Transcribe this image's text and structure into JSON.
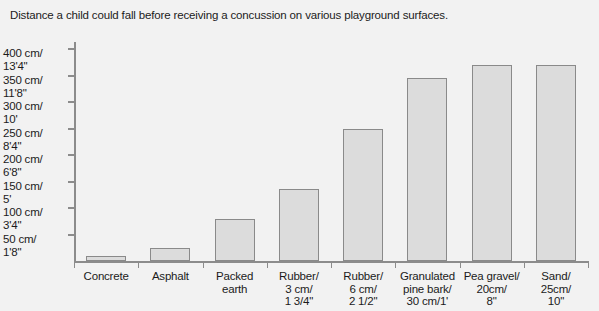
{
  "chart_data": {
    "type": "bar",
    "title": "Distance a child could fall before receiving a concussion on various playground surfaces.",
    "xlabel": "",
    "ylabel": "",
    "ylim": [
      0,
      420
    ],
    "grid": false,
    "legend": null,
    "units": "cm",
    "categories": [
      "Concrete",
      "Asphalt",
      "Packed earth",
      "Rubber/\n3 cm/\n1 3/4\"",
      "Rubber/\n6 cm/\n2 1/2\"",
      "Granulated\npine bark/\n30 cm/1'",
      "Pea gravel/\n20cm/\n8\"",
      "Sand/\n25cm/\n10\""
    ],
    "values": [
      10,
      25,
      80,
      135,
      250,
      345,
      370,
      370
    ],
    "ytick_values": [
      50,
      100,
      150,
      200,
      250,
      300,
      350,
      400
    ],
    "ytick_labels": [
      "50 cm/\n1'8\"",
      "100 cm/\n3'4\"",
      "150 cm/\n5'",
      "200 cm/\n6'8\"",
      "250 cm/\n8'4\"",
      "300 cm/\n10'",
      "350 cm/\n11'8\"",
      "400 cm/\n13'4\""
    ],
    "colors": {
      "bar_fill": "#dcdcdc",
      "bar_edge": "#8a8a8a",
      "axis": "#8c8c8c",
      "text": "#1b1b1b",
      "background": "#f2f2f2"
    }
  }
}
